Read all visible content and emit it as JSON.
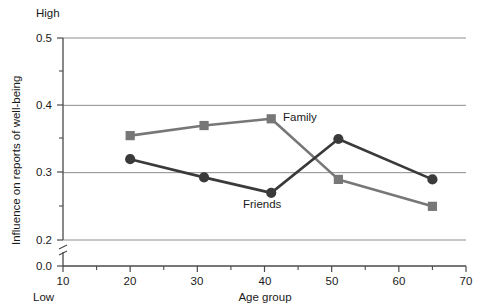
{
  "chart_data": {
    "type": "line",
    "title": "",
    "xlabel": "Age group",
    "ylabel": "Influence on reports of well-being",
    "x": [
      20,
      31,
      41,
      51,
      65
    ],
    "series": [
      {
        "name": "Family",
        "marker": "square",
        "color": "#777777",
        "values": [
          0.355,
          0.37,
          0.38,
          0.29,
          0.25
        ]
      },
      {
        "name": "Friends",
        "marker": "circle",
        "color": "#3a3a3a",
        "values": [
          0.32,
          0.293,
          0.27,
          0.35,
          0.29
        ]
      }
    ],
    "xlim": [
      10,
      70
    ],
    "ylim": [
      0.2,
      0.5
    ],
    "xticks": [
      10,
      20,
      30,
      40,
      50,
      60,
      70
    ],
    "xtick_labels": [
      "10",
      "20",
      "30",
      "40",
      "50",
      "60",
      "70"
    ],
    "x_minor_ticks": [
      15,
      25,
      35,
      45,
      55,
      65
    ],
    "yticks": [
      0.2,
      0.3,
      0.4,
      0.5
    ],
    "ytick_labels": [
      "0.2",
      "0.3",
      "0.4",
      "0.5"
    ],
    "y_minor_ticks": [
      0.25,
      0.35,
      0.45
    ],
    "y_axis_break": true,
    "y_origin_label": "0.0",
    "grid": "horizontal",
    "legend": "inline-annotations",
    "annotations": [
      {
        "text": "High",
        "position": "above-y-axis-top"
      },
      {
        "text": "Low",
        "position": "below-y-axis-bottom"
      },
      {
        "text": "Family",
        "position": "right-of-point-41"
      },
      {
        "text": "Friends",
        "position": "below-point-41"
      }
    ]
  },
  "axis": {
    "y_top_label": "High",
    "y_bottom_label": "Low",
    "x_title": "Age group",
    "y_title": "Influence on reports of well-being",
    "y_zero_label": "0.0"
  },
  "ytick_labels": {
    "t0": "0.2",
    "t1": "0.3",
    "t2": "0.4",
    "t3": "0.5"
  },
  "xtick_labels": {
    "t0": "10",
    "t1": "20",
    "t2": "30",
    "t3": "40",
    "t4": "50",
    "t5": "60",
    "t6": "70"
  },
  "series_labels": {
    "family": "Family",
    "friends": "Friends"
  },
  "colors": {
    "family": "#777777",
    "friends": "#3a3a3a",
    "grid": "#8d8d8d",
    "axis": "#4a4a4a",
    "text": "#1a1a1a",
    "background": "#ffffff"
  }
}
